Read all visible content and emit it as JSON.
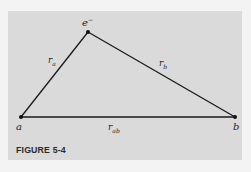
{
  "figure": {
    "caption": "FIGURE 5-4",
    "background_color": "#dadada",
    "line_color": "#1a1a1a"
  },
  "points": {
    "a": {
      "label": "a",
      "x": 21,
      "y": 117
    },
    "b": {
      "label": "b",
      "x": 235,
      "y": 117
    },
    "e": {
      "label": "e",
      "superscript": "−",
      "x": 88,
      "y": 32
    }
  },
  "edges": {
    "ra": {
      "from": "a",
      "to": "e",
      "label": "r",
      "subscript": "a"
    },
    "rb": {
      "from": "e",
      "to": "b",
      "label": "r",
      "subscript": "b"
    },
    "rab": {
      "from": "a",
      "to": "b",
      "label": "r",
      "subscript": "ab"
    }
  }
}
